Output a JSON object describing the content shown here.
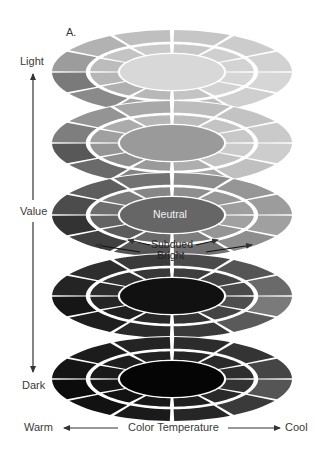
{
  "figure_label": "A.",
  "value_axis": {
    "top_label": "Light",
    "middle_label": "Value",
    "bottom_label": "Dark"
  },
  "temperature_axis": {
    "left_label": "Warm",
    "center_label": "Color Temperature",
    "right_label": "Cool"
  },
  "annotations": {
    "center_label": "Neutral",
    "inner_ring_label": "Subdued",
    "outer_ring_label": "Bright"
  },
  "discs": [
    {
      "level": "light",
      "cy": 72,
      "center_color": "#d8d8d8",
      "inner_colors": [
        "#c8c8c8",
        "#cfcfcf",
        "#d3d3d3",
        "#d6d6d6",
        "#d2d2d2",
        "#c4c4c4",
        "#b8b8b8",
        "#b0b0b0",
        "#b6b6b6",
        "#bcbcbc",
        "#c4c4c4",
        "#cacaca"
      ],
      "outer_colors": [
        "#c6c6c6",
        "#cccccc",
        "#d2d2d2",
        "#d6d6d6",
        "#cfcfcf",
        "#bdbdbd",
        "#a3a3a3",
        "#8a8a8a",
        "#7a7a7a",
        "#9c9c9c",
        "#b2b2b2",
        "#bfbfbf"
      ]
    },
    {
      "level": "light-mid",
      "cy": 143,
      "center_color": "#9a9a9a",
      "inner_colors": [
        "#bcbcbc",
        "#c4c4c4",
        "#c8c8c8",
        "#cbcbcb",
        "#c2c2c2",
        "#aeaeae",
        "#9a9a9a",
        "#8e8e8e",
        "#969696",
        "#a0a0a0",
        "#ababab",
        "#b6b6b6"
      ],
      "outer_colors": [
        "#bdbdbd",
        "#c3c3c3",
        "#cacaca",
        "#cdcdcd",
        "#c0c0c0",
        "#a4a4a4",
        "#848484",
        "#6a6a6a",
        "#585858",
        "#7e7e7e",
        "#949494",
        "#a8a8a8"
      ]
    },
    {
      "level": "middle",
      "cy": 215,
      "center_color": "#666666",
      "inner_colors": [
        "#8e8e8e",
        "#979797",
        "#9e9e9e",
        "#a1a1a1",
        "#959595",
        "#7e7e7e",
        "#6a6a6a",
        "#5c5c5c",
        "#636363",
        "#6e6e6e",
        "#7a7a7a",
        "#868686"
      ],
      "outer_colors": [
        "#8c8c8c",
        "#969696",
        "#9c9c9c",
        "#a0a0a0",
        "#8e8e8e",
        "#707070",
        "#555555",
        "#404040",
        "#333333",
        "#4c4c4c",
        "#5e5e5e",
        "#727272"
      ]
    },
    {
      "level": "dark-mid",
      "cy": 296,
      "center_color": "#111111",
      "inner_colors": [
        "#3e3e3e",
        "#444444",
        "#4a4a4a",
        "#4e4e4e",
        "#444444",
        "#333333",
        "#282828",
        "#202020",
        "#252525",
        "#2c2c2c",
        "#323232",
        "#383838"
      ],
      "outer_colors": [
        "#4a4a4a",
        "#555555",
        "#6a6a6a",
        "#7a7a7a",
        "#5a5a5a",
        "#3a3a3a",
        "#2a2a2a",
        "#1e1e1e",
        "#161616",
        "#242424",
        "#2e2e2e",
        "#3a3a3a"
      ]
    },
    {
      "level": "dark",
      "cy": 379,
      "center_color": "#050505",
      "inner_colors": [
        "#262626",
        "#2a2a2a",
        "#2e2e2e",
        "#323232",
        "#2a2a2a",
        "#202020",
        "#181818",
        "#121212",
        "#151515",
        "#1a1a1a",
        "#1e1e1e",
        "#222222"
      ],
      "outer_colors": [
        "#2c2c2c",
        "#343434",
        "#454545",
        "#555555",
        "#3a3a3a",
        "#262626",
        "#1a1a1a",
        "#121212",
        "#0c0c0c",
        "#151515",
        "#1c1c1c",
        "#242424"
      ]
    }
  ],
  "geometry": {
    "cx": 172,
    "outer_rx": 120,
    "outer_ry": 42,
    "mid_rx": 84,
    "mid_ry": 29,
    "inner_rx": 52,
    "inner_ry": 18
  }
}
